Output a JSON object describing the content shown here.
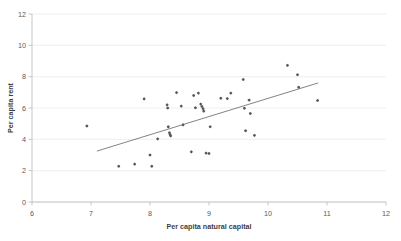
{
  "chart_data": {
    "type": "scatter",
    "title": "",
    "xlabel": "Per capita natural capital",
    "ylabel": "Per capita rent",
    "xlim": [
      6,
      12
    ],
    "ylim": [
      0,
      12
    ],
    "xticks": [
      6,
      7,
      8,
      9,
      10,
      11,
      12
    ],
    "yticks": [
      0,
      2,
      4,
      6,
      8,
      10,
      12
    ],
    "xtick_labels": [
      "6",
      "7",
      "8",
      "9",
      "10",
      "11",
      "12"
    ],
    "ytick_labels": [
      "0",
      "2",
      "4",
      "6",
      "8",
      "10",
      "12"
    ],
    "grid": "horizontal",
    "legend": "none",
    "marker_style": "diamond-plus",
    "marker_color": "#585858",
    "points": [
      {
        "x": 6.93,
        "y": 4.85
      },
      {
        "x": 7.47,
        "y": 2.28
      },
      {
        "x": 7.74,
        "y": 2.42
      },
      {
        "x": 7.9,
        "y": 6.58
      },
      {
        "x": 8.0,
        "y": 3.0
      },
      {
        "x": 8.03,
        "y": 2.28
      },
      {
        "x": 8.13,
        "y": 4.03
      },
      {
        "x": 8.29,
        "y": 6.2
      },
      {
        "x": 8.3,
        "y": 6.0
      },
      {
        "x": 8.31,
        "y": 4.8
      },
      {
        "x": 8.33,
        "y": 4.42
      },
      {
        "x": 8.34,
        "y": 4.3
      },
      {
        "x": 8.35,
        "y": 4.22
      },
      {
        "x": 8.45,
        "y": 6.98
      },
      {
        "x": 8.53,
        "y": 6.12
      },
      {
        "x": 8.56,
        "y": 4.92
      },
      {
        "x": 8.7,
        "y": 3.2
      },
      {
        "x": 8.74,
        "y": 6.8
      },
      {
        "x": 8.77,
        "y": 6.02
      },
      {
        "x": 8.82,
        "y": 6.95
      },
      {
        "x": 8.86,
        "y": 6.25
      },
      {
        "x": 8.88,
        "y": 6.1
      },
      {
        "x": 8.9,
        "y": 5.95
      },
      {
        "x": 8.91,
        "y": 5.8
      },
      {
        "x": 8.95,
        "y": 3.12
      },
      {
        "x": 9.0,
        "y": 3.1
      },
      {
        "x": 9.02,
        "y": 4.8
      },
      {
        "x": 9.2,
        "y": 6.62
      },
      {
        "x": 9.31,
        "y": 6.6
      },
      {
        "x": 9.37,
        "y": 6.95
      },
      {
        "x": 9.58,
        "y": 7.82
      },
      {
        "x": 9.6,
        "y": 5.98
      },
      {
        "x": 9.62,
        "y": 4.55
      },
      {
        "x": 9.68,
        "y": 6.5
      },
      {
        "x": 9.7,
        "y": 5.65
      },
      {
        "x": 9.77,
        "y": 4.25
      },
      {
        "x": 10.33,
        "y": 8.72
      },
      {
        "x": 10.5,
        "y": 8.12
      },
      {
        "x": 10.52,
        "y": 7.32
      },
      {
        "x": 10.84,
        "y": 6.48
      }
    ],
    "trendline": {
      "x0": 7.1,
      "y0": 3.25,
      "x1": 10.85,
      "y1": 7.6,
      "color": "#6d6d6d"
    }
  }
}
